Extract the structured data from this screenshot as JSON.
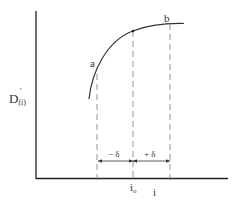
{
  "diagram": {
    "y_axis_label": "D",
    "y_axis_label_sup": "'",
    "y_axis_label_sub": "(i)",
    "point_a_label": "a",
    "point_b_label": "b",
    "minus_delta_label": "− δ",
    "plus_delta_label": "+ δ",
    "x_center_label": "i",
    "x_center_label_sub": "o",
    "x_axis_label": "i",
    "colors": {
      "axis": "#222222",
      "curve": "#333333",
      "dashed": "#777777",
      "text": "#333333"
    }
  }
}
